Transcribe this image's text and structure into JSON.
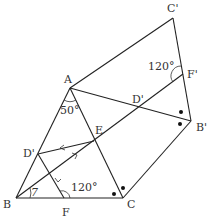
{
  "diagram": {
    "type": "geometry-figure",
    "points": {
      "C_prime": {
        "label": "C'",
        "x": 173,
        "y": 18,
        "lx": 167,
        "ly": 12
      },
      "A": {
        "label": "A",
        "x": 70,
        "y": 88,
        "lx": 64,
        "ly": 83
      },
      "F_prime": {
        "label": "F'",
        "x": 183,
        "y": 74,
        "lx": 188,
        "ly": 77
      },
      "D_prime_top": {
        "label": "D'",
        "x": 138,
        "y": 108,
        "lx": 132,
        "ly": 103
      },
      "B_prime": {
        "label": "B'",
        "x": 191,
        "y": 121,
        "lx": 196,
        "ly": 131
      },
      "E": {
        "label": "E",
        "x": 94,
        "y": 141,
        "lx": 95,
        "ly": 134
      },
      "D_prime_left": {
        "label": "D'",
        "x": 38,
        "y": 154,
        "lx": 23,
        "ly": 157
      },
      "B": {
        "label": "B",
        "x": 16,
        "y": 198,
        "lx": 3,
        "ly": 208
      },
      "F": {
        "label": "F",
        "x": 64,
        "y": 198,
        "lx": 62,
        "ly": 215
      },
      "C": {
        "label": "C",
        "x": 123,
        "y": 198,
        "lx": 127,
        "ly": 208
      }
    },
    "angles": {
      "A": {
        "text": "50°",
        "x": 60,
        "y": 114
      },
      "F": {
        "text": "120°",
        "x": 71,
        "y": 191
      },
      "F_prime": {
        "text": "120°",
        "x": 148,
        "y": 70
      },
      "B": {
        "text": "7",
        "x": 31,
        "y": 196
      }
    },
    "markers": {
      "dots_near_B_prime": 2,
      "dots_near_C": 2,
      "arrows": [
        "on E-D' (pointing left)",
        "on B-E (pointing right)",
        "on D'-F (pointing down)"
      ]
    }
  }
}
